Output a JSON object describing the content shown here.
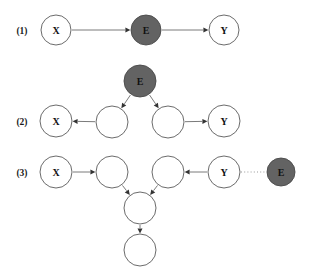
{
  "figure": {
    "background_color": "#ffffff",
    "filled_node_color": "#636363",
    "open_node_color": "#ffffff",
    "node_stroke_color": "#5a5a5a",
    "edge_color": "#6b6b6b",
    "dotted_edge_color": "#9a9a9a",
    "arrow_color": "#333333"
  },
  "rows": [
    {
      "label": "(1)",
      "label_x": 22,
      "label_y": 31,
      "nodes": [
        {
          "id": "r1-x",
          "name": "node-x",
          "text": "X",
          "cx": 56,
          "cy": 30,
          "r": 15,
          "filled": false
        },
        {
          "id": "r1-e",
          "name": "node-e",
          "text": "E",
          "cx": 146,
          "cy": 30,
          "r": 15,
          "filled": true
        },
        {
          "id": "r1-y",
          "name": "node-y",
          "text": "Y",
          "cx": 224,
          "cy": 30,
          "r": 15,
          "filled": false
        }
      ],
      "edges": [
        {
          "name": "edge-x-to-e",
          "from": "r1-x",
          "to": "r1-e",
          "style": "solid",
          "arrow": true
        },
        {
          "name": "edge-e-to-y",
          "from": "r1-e",
          "to": "r1-y",
          "style": "solid",
          "arrow": true
        }
      ]
    },
    {
      "label": "(2)",
      "label_x": 22,
      "label_y": 122,
      "nodes": [
        {
          "id": "r2-e",
          "name": "node-e",
          "text": "E",
          "cx": 140,
          "cy": 81,
          "r": 16,
          "filled": true
        },
        {
          "id": "r2-x",
          "name": "node-x",
          "text": "X",
          "cx": 56,
          "cy": 121,
          "r": 16,
          "filled": false
        },
        {
          "id": "r2-m1",
          "name": "node-latent-left",
          "text": "",
          "cx": 112,
          "cy": 122,
          "r": 16,
          "filled": false
        },
        {
          "id": "r2-m2",
          "name": "node-latent-right",
          "text": "",
          "cx": 168,
          "cy": 122,
          "r": 16,
          "filled": false
        },
        {
          "id": "r2-y",
          "name": "node-y",
          "text": "Y",
          "cx": 224,
          "cy": 121,
          "r": 16,
          "filled": false
        }
      ],
      "edges": [
        {
          "name": "edge-e-to-latent-left",
          "from": "r2-e",
          "to": "r2-m1",
          "style": "solid",
          "arrow": true
        },
        {
          "name": "edge-e-to-latent-right",
          "from": "r2-e",
          "to": "r2-m2",
          "style": "solid",
          "arrow": true
        },
        {
          "name": "edge-latent-left-to-x",
          "from": "r2-m1",
          "to": "r2-x",
          "style": "solid",
          "arrow": true
        },
        {
          "name": "edge-latent-right-to-y",
          "from": "r2-m2",
          "to": "r2-y",
          "style": "solid",
          "arrow": true
        }
      ]
    },
    {
      "label": "(3)",
      "label_x": 22,
      "label_y": 173,
      "nodes": [
        {
          "id": "r3-x",
          "name": "node-x",
          "text": "X",
          "cx": 56,
          "cy": 172,
          "r": 16,
          "filled": false
        },
        {
          "id": "r3-m1",
          "name": "node-latent-left",
          "text": "",
          "cx": 112,
          "cy": 172,
          "r": 16,
          "filled": false
        },
        {
          "id": "r3-m2",
          "name": "node-latent-right",
          "text": "",
          "cx": 168,
          "cy": 172,
          "r": 16,
          "filled": false
        },
        {
          "id": "r3-y",
          "name": "node-y",
          "text": "Y",
          "cx": 224,
          "cy": 172,
          "r": 16,
          "filled": false
        },
        {
          "id": "r3-e",
          "name": "node-e",
          "text": "E",
          "cx": 281,
          "cy": 172,
          "r": 14,
          "filled": true
        },
        {
          "id": "r3-c",
          "name": "node-collider",
          "text": "",
          "cx": 140,
          "cy": 208,
          "r": 16,
          "filled": false
        },
        {
          "id": "r3-d",
          "name": "node-descendant",
          "text": "",
          "cx": 140,
          "cy": 250,
          "r": 16,
          "filled": false
        }
      ],
      "edges": [
        {
          "name": "edge-x-to-latent-left",
          "from": "r3-x",
          "to": "r3-m1",
          "style": "solid",
          "arrow": true
        },
        {
          "name": "edge-y-to-latent-right",
          "from": "r3-y",
          "to": "r3-m2",
          "style": "solid",
          "arrow": true
        },
        {
          "name": "edge-latent-left-to-collider",
          "from": "r3-m1",
          "to": "r3-c",
          "style": "solid",
          "arrow": true
        },
        {
          "name": "edge-latent-right-to-collider",
          "from": "r3-m2",
          "to": "r3-c",
          "style": "solid",
          "arrow": true
        },
        {
          "name": "edge-collider-to-descendant",
          "from": "r3-c",
          "to": "r3-d",
          "style": "solid",
          "arrow": true
        },
        {
          "name": "edge-y-to-e-dotted",
          "from": "r3-y",
          "to": "r3-e",
          "style": "dotted",
          "arrow": false
        }
      ]
    }
  ]
}
